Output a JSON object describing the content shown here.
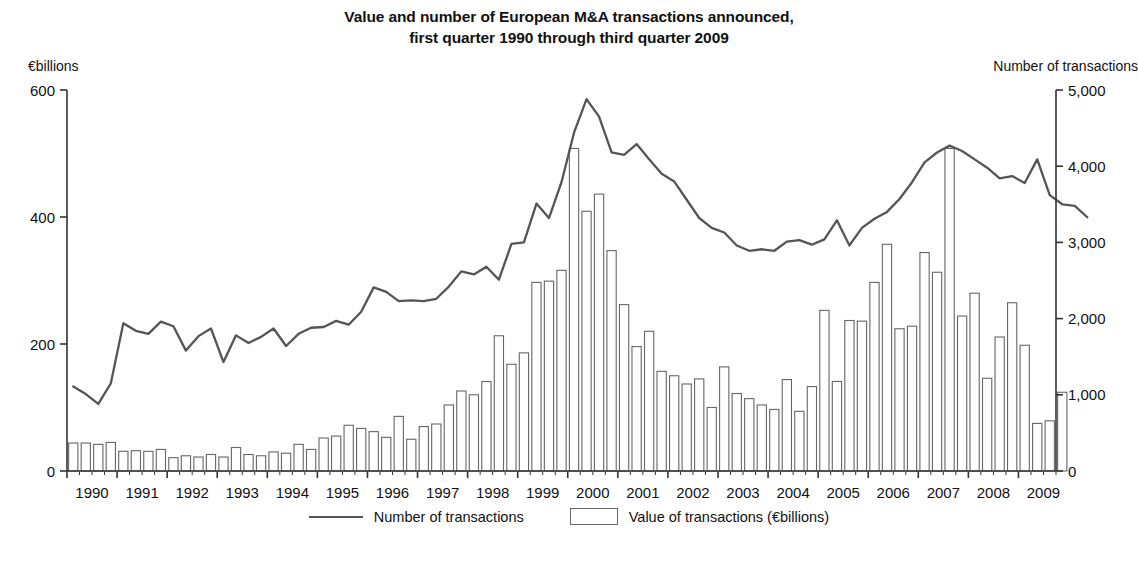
{
  "title": {
    "line1": "Value and number of European M&A transactions announced,",
    "line2": "first quarter 1990 through third quarter 2009"
  },
  "axis_captions": {
    "left": "€billions",
    "right": "Number of transactions"
  },
  "legend": {
    "line_label": "Number of transactions",
    "bar_label": "Value of transactions (€billions)"
  },
  "colors": {
    "line": "#555555",
    "bar_stroke": "#666666",
    "bar_fill": "#ffffff",
    "axis": "#333333",
    "text": "#111111"
  },
  "chart_data": {
    "type": "bar",
    "title": "Value and number of European M&A transactions announced, first quarter 1990 through third quarter 2009",
    "xlabel": "",
    "ylabel": "€billions",
    "y2label": "Number of transactions",
    "ylim": [
      0,
      600
    ],
    "y2lim": [
      0,
      5000
    ],
    "yticks": [
      0,
      200,
      400,
      600
    ],
    "ytick_labels": [
      "0",
      "200",
      "400",
      "600"
    ],
    "y2ticks": [
      0,
      1000,
      2000,
      3000,
      4000,
      5000
    ],
    "y2tick_labels": [
      "0",
      "1,000",
      "2,000",
      "3,000",
      "4,000",
      "5,000"
    ],
    "xtick_labels": [
      "1990",
      "1991",
      "1992",
      "1993",
      "1994",
      "1995",
      "1996",
      "1997",
      "1998",
      "1999",
      "2000",
      "2001",
      "2002",
      "2003",
      "2004",
      "2005",
      "2006",
      "2007",
      "2008",
      "2009"
    ],
    "grid": false,
    "legend_position": "bottom",
    "quarters": [
      "1990Q1",
      "1990Q2",
      "1990Q3",
      "1990Q4",
      "1991Q1",
      "1991Q2",
      "1991Q3",
      "1991Q4",
      "1992Q1",
      "1992Q2",
      "1992Q3",
      "1992Q4",
      "1993Q1",
      "1993Q2",
      "1993Q3",
      "1993Q4",
      "1994Q1",
      "1994Q2",
      "1994Q3",
      "1994Q4",
      "1995Q1",
      "1995Q2",
      "1995Q3",
      "1995Q4",
      "1996Q1",
      "1996Q2",
      "1996Q3",
      "1996Q4",
      "1997Q1",
      "1997Q2",
      "1997Q3",
      "1997Q4",
      "1998Q1",
      "1998Q2",
      "1998Q3",
      "1998Q4",
      "1999Q1",
      "1999Q2",
      "1999Q3",
      "1999Q4",
      "2000Q1",
      "2000Q2",
      "2000Q3",
      "2000Q4",
      "2001Q1",
      "2001Q2",
      "2001Q3",
      "2001Q4",
      "2002Q1",
      "2002Q2",
      "2002Q3",
      "2002Q4",
      "2003Q1",
      "2003Q2",
      "2003Q3",
      "2003Q4",
      "2004Q1",
      "2004Q2",
      "2004Q3",
      "2004Q4",
      "2005Q1",
      "2005Q2",
      "2005Q3",
      "2005Q4",
      "2006Q1",
      "2006Q2",
      "2006Q3",
      "2006Q4",
      "2007Q1",
      "2007Q2",
      "2007Q3",
      "2007Q4",
      "2008Q1",
      "2008Q2",
      "2008Q3",
      "2008Q4",
      "2009Q1",
      "2009Q2",
      "2009Q3"
    ],
    "series": [
      {
        "name": "Value of transactions (€billions)",
        "type": "bar",
        "axis": "left",
        "unit": "€billions",
        "values": [
          44,
          44,
          42,
          45,
          31,
          32,
          31,
          34,
          21,
          24,
          22,
          26,
          22,
          37,
          26,
          24,
          30,
          28,
          42,
          34,
          52,
          55,
          72,
          67,
          62,
          53,
          86,
          50,
          70,
          74,
          104,
          126,
          120,
          141,
          213,
          168,
          186,
          297,
          299,
          316,
          508,
          409,
          436,
          347,
          262,
          196,
          220,
          157,
          150,
          137,
          145,
          100,
          164,
          122,
          114,
          104,
          97,
          144,
          94,
          133,
          253,
          141,
          237,
          236,
          297,
          357,
          224,
          228,
          344,
          313,
          508,
          244,
          280,
          146,
          211,
          265,
          198,
          75,
          79,
          124
        ]
      },
      {
        "name": "Number of transactions",
        "type": "line",
        "axis": "right",
        "unit": "transactions",
        "values": [
          1110,
          1010,
          880,
          1150,
          1940,
          1840,
          1800,
          1960,
          1900,
          1580,
          1770,
          1870,
          1430,
          1780,
          1680,
          1760,
          1870,
          1640,
          1800,
          1880,
          1890,
          1970,
          1920,
          2090,
          2410,
          2350,
          2230,
          2240,
          2230,
          2260,
          2420,
          2620,
          2580,
          2680,
          2510,
          2980,
          3000,
          3510,
          3320,
          3790,
          4440,
          4880,
          4650,
          4180,
          4150,
          4290,
          4090,
          3900,
          3800,
          3560,
          3320,
          3190,
          3130,
          2960,
          2890,
          2910,
          2890,
          3010,
          3030,
          2970,
          3040,
          3290,
          2960,
          3190,
          3310,
          3400,
          3570,
          3790,
          4050,
          4180,
          4270,
          4200,
          4090,
          3980,
          3840,
          3870,
          3780,
          4090,
          3620,
          3500,
          3480,
          3330
        ]
      }
    ]
  }
}
